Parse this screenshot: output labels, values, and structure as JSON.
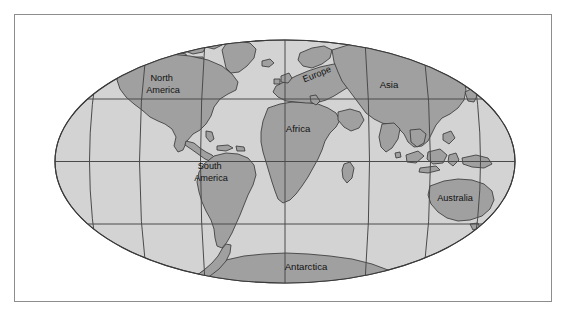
{
  "figure": {
    "type": "world-map",
    "projection": "Mollweide (oval equal-area)",
    "frame": {
      "visible": true,
      "border_color": "#8d8d8d",
      "background": "#ffffff"
    },
    "colors": {
      "ocean": "#d3d3d3",
      "land": "#a0a0a0",
      "land_highlight": "#b4b4b4",
      "outline": "#3a3a3a",
      "graticule": "#4a4a4a",
      "label_text": "#111111",
      "frame_border": "#8d8d8d",
      "page_background": "#ffffff"
    },
    "graticule": {
      "meridian_count": 7,
      "parallel_count": 3,
      "parallels": [
        "30N",
        "0 (Equator)",
        "30S"
      ],
      "visible": true
    }
  },
  "labels": [
    {
      "id": "north-america",
      "text_line_1": "North",
      "text_line_2": "America",
      "x": 163,
      "y": 81,
      "rotation": 0
    },
    {
      "id": "south-america",
      "text_line_1": "South",
      "text_line_2": "America",
      "x": 211,
      "y": 169,
      "rotation": 0
    },
    {
      "id": "europe",
      "text_line_1": "Europe",
      "text_line_2": "",
      "x": 318,
      "y": 77,
      "rotation": -22
    },
    {
      "id": "africa",
      "text_line_1": "Africa",
      "text_line_2": "",
      "x": 298,
      "y": 132,
      "rotation": 0
    },
    {
      "id": "asia",
      "text_line_1": "Asia",
      "text_line_2": "",
      "x": 389,
      "y": 88,
      "rotation": 0
    },
    {
      "id": "australia",
      "text_line_1": "Australia",
      "text_line_2": "",
      "x": 455,
      "y": 201,
      "rotation": 0
    },
    {
      "id": "antarctica",
      "text_line_1": "Antarctica",
      "text_line_2": "",
      "x": 306,
      "y": 270,
      "rotation": 0
    }
  ],
  "continents": [
    {
      "id": "north-america",
      "name": "North America"
    },
    {
      "id": "south-america",
      "name": "South America"
    },
    {
      "id": "europe",
      "name": "Europe"
    },
    {
      "id": "africa",
      "name": "Africa"
    },
    {
      "id": "asia",
      "name": "Asia"
    },
    {
      "id": "australia",
      "name": "Australia"
    },
    {
      "id": "antarctica",
      "name": "Antarctica"
    }
  ]
}
